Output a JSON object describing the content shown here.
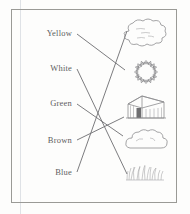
{
  "worksheet": {
    "title": "Color word to picture matching worksheet",
    "frame_color": "#9a9a96",
    "line_color": "#6d6d70",
    "ink_color": "#8d8d8f",
    "labels": [
      {
        "id": "yellow",
        "text": "Yellow",
        "x": 72,
        "y": 33
      },
      {
        "id": "white",
        "text": "White",
        "x": 72,
        "y": 68
      },
      {
        "id": "green",
        "text": "Green",
        "x": 72,
        "y": 103
      },
      {
        "id": "brown",
        "text": "Brown",
        "x": 72,
        "y": 140
      },
      {
        "id": "blue",
        "text": "Blue",
        "x": 72,
        "y": 172
      }
    ],
    "pictures": [
      {
        "id": "cloud-blob",
        "name": "cloud-blob-icon",
        "cx": 146,
        "cy": 36
      },
      {
        "id": "sun",
        "name": "sun-icon",
        "cx": 146,
        "cy": 72
      },
      {
        "id": "house",
        "name": "house-icon",
        "cx": 146,
        "cy": 111
      },
      {
        "id": "cloud",
        "name": "cloud-icon",
        "cx": 146,
        "cy": 143
      },
      {
        "id": "grass",
        "name": "grass-icon",
        "cx": 146,
        "cy": 176
      }
    ],
    "connections": [
      {
        "id": "yellow-to-sun",
        "from": "yellow",
        "to": "sun",
        "x1": 77,
        "y1": 34,
        "x2": 125,
        "y2": 70
      },
      {
        "id": "white-to-grass",
        "from": "white",
        "to": "grass",
        "x1": 77,
        "y1": 69,
        "x2": 127,
        "y2": 174
      },
      {
        "id": "green-to-cloud",
        "from": "green",
        "to": "cloud",
        "x1": 77,
        "y1": 104,
        "x2": 123,
        "y2": 136
      },
      {
        "id": "brown-to-house",
        "from": "brown",
        "to": "house",
        "x1": 77,
        "y1": 140,
        "x2": 124,
        "y2": 117
      },
      {
        "id": "blue-to-blob",
        "from": "blue",
        "to": "cloud-blob",
        "x1": 77,
        "y1": 172,
        "x2": 127,
        "y2": 31
      }
    ]
  }
}
